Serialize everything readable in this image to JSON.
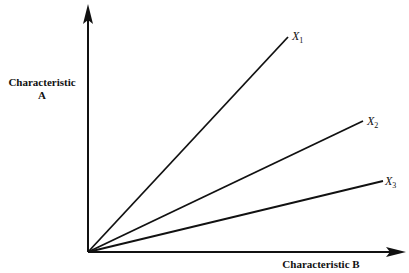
{
  "diagram": {
    "y_axis_label_line1": "Characteristic",
    "y_axis_label_line2": "A",
    "x_axis_label": "Characteristic B",
    "lines": [
      {
        "name": "X",
        "sub": "1"
      },
      {
        "name": "X",
        "sub": "2"
      },
      {
        "name": "X",
        "sub": "3"
      }
    ],
    "colors": {
      "ink": "#111111",
      "background": "#ffffff"
    }
  }
}
